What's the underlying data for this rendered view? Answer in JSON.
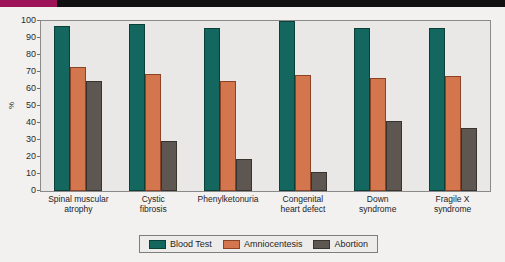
{
  "decor": {
    "top_bar_color": "#111111",
    "top_bar_accent_color": "#9c1457"
  },
  "chart_data": {
    "type": "bar",
    "title": "",
    "xlabel": "",
    "ylabel": "%",
    "ylim": [
      0,
      100
    ],
    "grid": false,
    "legend_position": "bottom",
    "categories": [
      "Spinal muscular atrophy",
      "Cystic fibrosis",
      "Phenylketonuria",
      "Congenital heart defect",
      "Down syndrome",
      "Fragile X syndrome"
    ],
    "category_lines": [
      [
        "Spinal muscular",
        "atrophy"
      ],
      [
        "Cystic",
        "fibrosis"
      ],
      [
        "Phenylketonuria",
        ""
      ],
      [
        "Congenital",
        "heart defect"
      ],
      [
        "Down",
        "syndrome"
      ],
      [
        "Fragile X",
        "syndrome"
      ]
    ],
    "ytick_labels": [
      "100",
      "90",
      "80",
      "70",
      "60",
      "50",
      "40",
      "30",
      "20",
      "10",
      "0"
    ],
    "ytick_values": [
      100,
      90,
      80,
      70,
      60,
      50,
      40,
      30,
      20,
      10,
      0
    ],
    "series": [
      {
        "name": "Blood Test",
        "color": "#14675e",
        "values": [
          97,
          98,
          96,
          100,
          96,
          96
        ]
      },
      {
        "name": "Amniocentesis",
        "color": "#d4764d",
        "values": [
          73,
          69,
          64.5,
          68,
          66.5,
          67.5
        ]
      },
      {
        "name": "Abortion",
        "color": "#5e5650",
        "values": [
          65,
          29.5,
          19,
          11,
          41,
          37
        ]
      }
    ]
  }
}
